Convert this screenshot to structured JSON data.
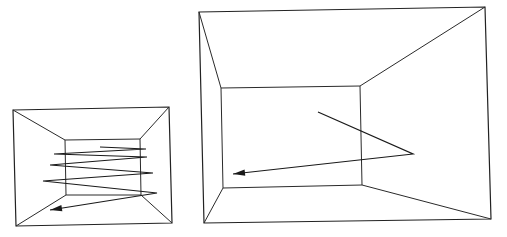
{
  "figures": [
    {
      "name": "small-room",
      "outer": [
        [
          13,
          110
        ],
        [
          169,
          107
        ],
        [
          172,
          223
        ],
        [
          16,
          226
        ]
      ],
      "inner": [
        [
          65,
          140
        ],
        [
          140,
          139
        ],
        [
          141,
          195
        ],
        [
          66,
          195
        ]
      ],
      "trajectory": [
        [
          100,
          147
        ],
        [
          146,
          149
        ],
        [
          54,
          154
        ],
        [
          147,
          157
        ],
        [
          50,
          165
        ],
        [
          153,
          173
        ],
        [
          43,
          181
        ],
        [
          157,
          193
        ],
        [
          50,
          210
        ]
      ],
      "arrow_tip": [
        50,
        210
      ]
    },
    {
      "name": "large-room",
      "outer": [
        [
          199,
          12
        ],
        [
          485,
          7
        ],
        [
          491,
          219
        ],
        [
          204,
          223
        ]
      ],
      "inner": [
        [
          221,
          88
        ],
        [
          360,
          86
        ],
        [
          362,
          185
        ],
        [
          223,
          188
        ]
      ],
      "trajectory": [
        [
          318,
          112
        ],
        [
          413,
          154
        ],
        [
          233,
          174
        ]
      ],
      "arrow_tip": [
        233,
        174
      ]
    }
  ],
  "colors": {
    "line": "#2a2a2a",
    "background": "#ffffff"
  }
}
